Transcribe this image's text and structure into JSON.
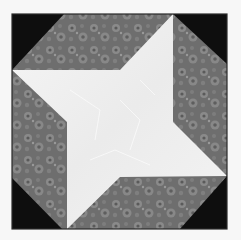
{
  "image": {
    "subject": "quilt block",
    "description": "Square quilt block with a white four-pointed pinwheel star on a grey floral print background, with black triangular corners",
    "width": 241,
    "height": 240
  },
  "colors": {
    "page_background": "#f7f7f7",
    "border": "#2a2a2a",
    "corner_black": "#0e0e0e",
    "print_base": "#6e6e6e",
    "print_light": "#8f8f8f",
    "print_dark": "#555555",
    "star_white": "#f2f2f2",
    "star_shade": "#e3e3e3"
  },
  "geometry": {
    "block": {
      "x": 12,
      "y": 14,
      "w": 215,
      "h": 215
    },
    "corners": [
      {
        "name": "top-left",
        "points": "12,14 64,14 12,70"
      },
      {
        "name": "top-right",
        "points": "173,14 227,14 227,64"
      },
      {
        "name": "bottom-right",
        "points": "227,176 227,229 180,229"
      },
      {
        "name": "bottom-left",
        "points": "12,178 62,229 12,229"
      }
    ],
    "star": "12,70 120,70 173,14 173,122 227,176 120,177 67,229 67,122"
  }
}
